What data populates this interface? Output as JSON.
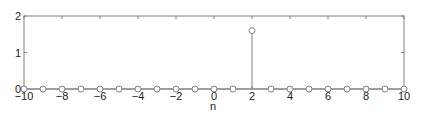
{
  "chart_data": {
    "type": "stem",
    "title": "",
    "xlabel": "n",
    "ylabel": "",
    "xlim": [
      -10,
      10
    ],
    "ylim": [
      0,
      2
    ],
    "xticks": [
      -10,
      -8,
      -6,
      -4,
      -2,
      0,
      2,
      4,
      6,
      8,
      10
    ],
    "xtick_labels": [
      "−10",
      "−8",
      "−6",
      "−4",
      "−2",
      "0",
      "2",
      "4",
      "6",
      "8",
      "10"
    ],
    "yticks": [
      0,
      1,
      2
    ],
    "ytick_labels": [
      "0",
      "1",
      "2"
    ],
    "grid": false,
    "legend": null,
    "x": [
      -10,
      -9,
      -8,
      -7,
      -6,
      -5,
      -4,
      -3,
      -2,
      -1,
      0,
      1,
      2,
      3,
      4,
      5,
      6,
      7,
      8,
      9,
      10
    ],
    "values": [
      0,
      0,
      0,
      0,
      0,
      0,
      0,
      0,
      0,
      0,
      0,
      0,
      1.6,
      0,
      0,
      0,
      0,
      0,
      0,
      0,
      0
    ],
    "marker": "circle-open",
    "color": "#808080"
  }
}
